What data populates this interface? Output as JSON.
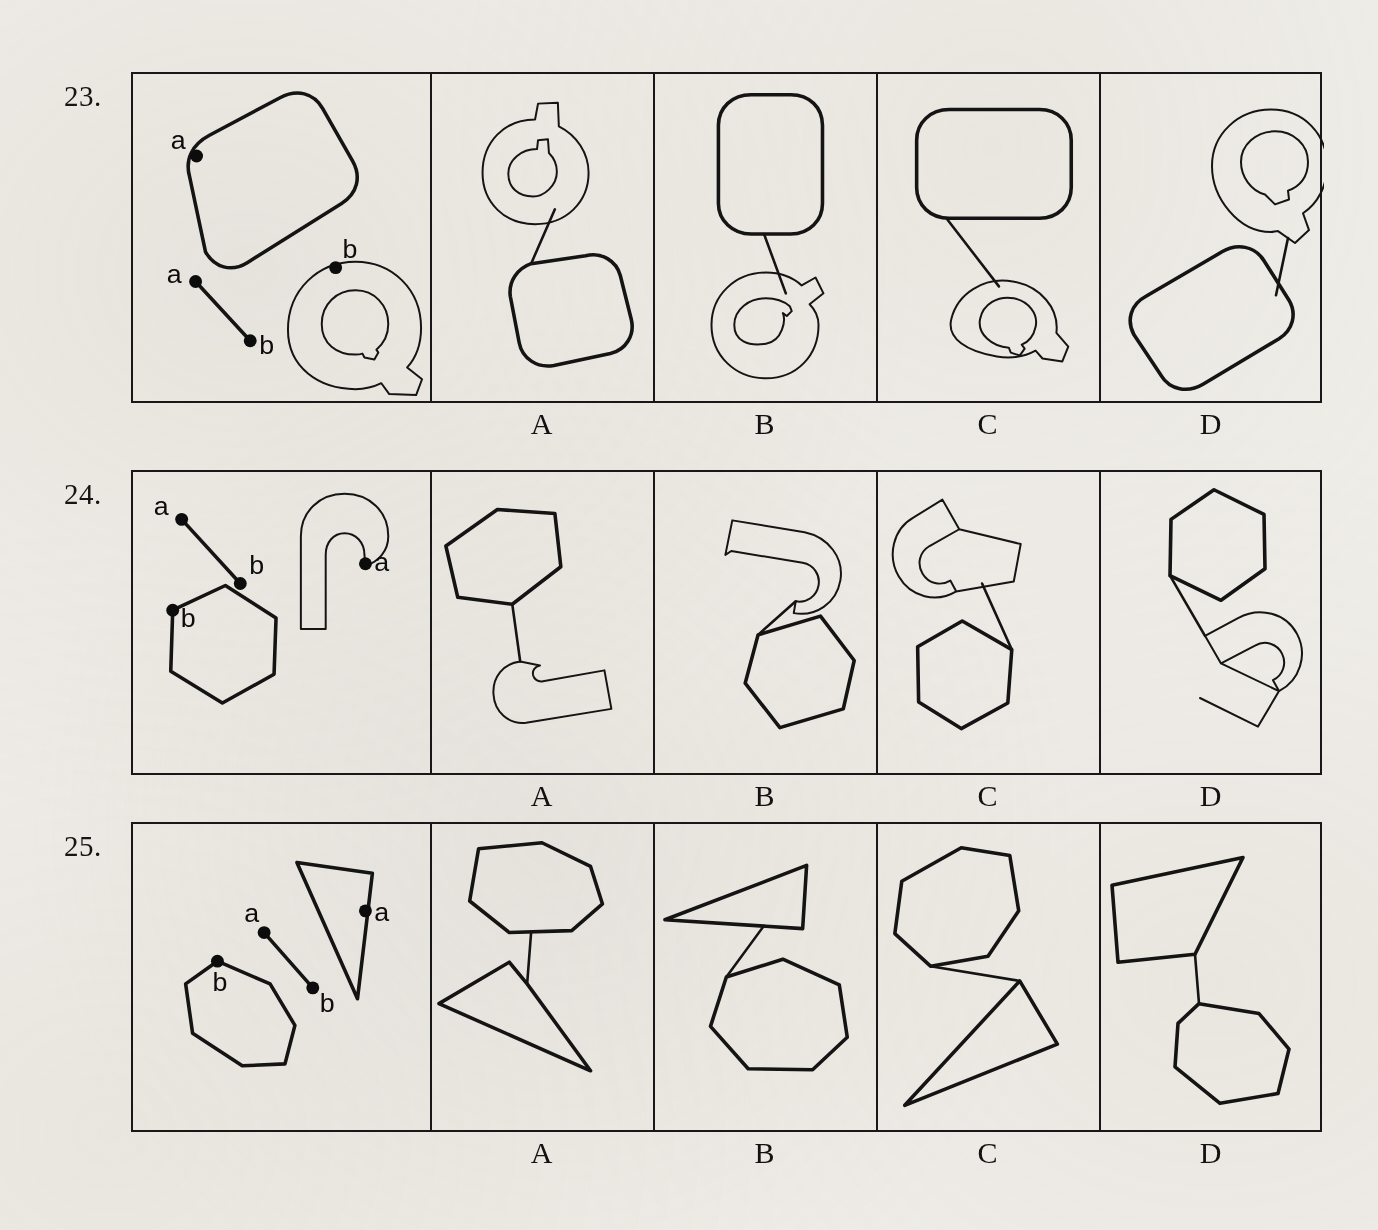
{
  "page": {
    "background_color": "#f0eee9",
    "ink_color": "#141414",
    "kind": "printed-test-page"
  },
  "option_labels": [
    "A",
    "B",
    "C",
    "D"
  ],
  "point_labels": {
    "a": "a",
    "b": "b"
  },
  "rows": [
    {
      "number": "23.",
      "stimulus": {
        "shapes": [
          "rounded-rectangle",
          "letter-Q-outline"
        ],
        "connector": "segment-a-to-b",
        "marks": [
          {
            "label": "a",
            "on": "rounded-rectangle"
          },
          {
            "label": "b",
            "on": "letter-Q-outline"
          },
          {
            "label": "a",
            "on": "connector-start"
          },
          {
            "label": "b",
            "on": "connector-end"
          }
        ]
      },
      "options": [
        {
          "letter": "A",
          "shapes": [
            "letter-Q-outline",
            "rounded-rectangle"
          ]
        },
        {
          "letter": "B",
          "shapes": [
            "rounded-rectangle",
            "letter-Q-outline"
          ]
        },
        {
          "letter": "C",
          "shapes": [
            "rounded-rectangle",
            "letter-Q-outline"
          ]
        },
        {
          "letter": "D",
          "shapes": [
            "letter-Q-outline",
            "rounded-rectangle"
          ]
        }
      ]
    },
    {
      "number": "24.",
      "stimulus": {
        "shapes": [
          "hexagon",
          "hook-outline"
        ],
        "connector": "segment-a-to-b",
        "marks": [
          {
            "label": "a",
            "on": "connector-start"
          },
          {
            "label": "b",
            "on": "connector-end"
          },
          {
            "label": "a",
            "on": "hook-outline"
          },
          {
            "label": "b",
            "on": "hexagon"
          }
        ]
      },
      "options": [
        {
          "letter": "A",
          "shapes": [
            "hexagon",
            "hook-outline"
          ]
        },
        {
          "letter": "B",
          "shapes": [
            "hook-outline",
            "hexagon"
          ]
        },
        {
          "letter": "C",
          "shapes": [
            "hook-outline",
            "hexagon"
          ]
        },
        {
          "letter": "D",
          "shapes": [
            "hexagon",
            "hook-outline"
          ]
        }
      ]
    },
    {
      "number": "25.",
      "stimulus": {
        "shapes": [
          "heptagon",
          "narrow-triangle"
        ],
        "connector": "segment-a-to-b",
        "marks": [
          {
            "label": "a",
            "on": "connector-start"
          },
          {
            "label": "b",
            "on": "connector-end"
          },
          {
            "label": "a",
            "on": "narrow-triangle"
          },
          {
            "label": "b",
            "on": "heptagon"
          }
        ]
      },
      "options": [
        {
          "letter": "A",
          "shapes": [
            "heptagon",
            "narrow-triangle"
          ]
        },
        {
          "letter": "B",
          "shapes": [
            "narrow-triangle",
            "heptagon"
          ]
        },
        {
          "letter": "C",
          "shapes": [
            "heptagon",
            "narrow-triangle"
          ]
        },
        {
          "letter": "D",
          "shapes": [
            "narrow-triangle",
            "heptagon"
          ]
        }
      ]
    }
  ],
  "layout": {
    "grid_left": 131,
    "grid_right": 1322,
    "rows_top": [
      72,
      470,
      822
    ],
    "rows_height": [
      331,
      305,
      310
    ],
    "stimulus_panel_width": 299,
    "option_panel_width": 223
  }
}
